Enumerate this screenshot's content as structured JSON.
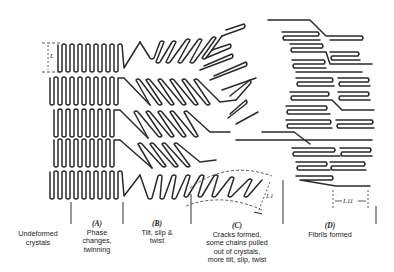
{
  "diagram": {
    "dimensions": {
      "lamella_thickness": "L",
      "lamella_thickness_cracked": "L1",
      "fibril_period": "L11"
    },
    "stages": [
      {
        "id": "undeformed",
        "letter": "",
        "lines": [
          "Undeformed",
          "crystals"
        ]
      },
      {
        "id": "A",
        "letter": "(A)",
        "lines": [
          "Phase",
          "changes,",
          "twinning"
        ]
      },
      {
        "id": "B",
        "letter": "(B)",
        "lines": [
          "Tilt, slip &",
          "twist"
        ]
      },
      {
        "id": "C",
        "letter": "(C)",
        "lines": [
          "Cracks formed,",
          "some chains pulled",
          "out of crystals,",
          "more tilt, slip, twist"
        ]
      },
      {
        "id": "D",
        "letter": "(D)",
        "lines": [
          "Fibrils formed"
        ]
      }
    ],
    "dividers_x": [
      71,
      123,
      191,
      283,
      357
    ],
    "colors": {
      "ink": "#2a2a2a",
      "background": "#ffffff"
    }
  }
}
